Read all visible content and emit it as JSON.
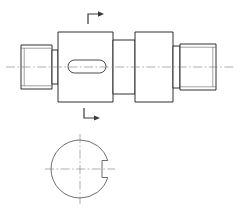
{
  "drawing": {
    "title": "Stepped Shaft with Keyway",
    "sheet_background": "#ffffff",
    "line_color": "#1a1a1a",
    "centerline_color": "#7a7a7a",
    "hatch_color": "#6e6e6e",
    "views": [
      {
        "id": "main-elevation",
        "name": "Main Elevation View",
        "description": "Side view of stepped cylindrical shaft, axis horizontal",
        "axis_y": 67,
        "axis_start_x": 6,
        "axis_end_x": 234,
        "steps": [
          {
            "name": "thread-end-left",
            "x": 21,
            "width": 31,
            "half_height": 22,
            "threaded": true
          },
          {
            "name": "shoulder-left",
            "x": 52,
            "width": 6,
            "half_height": 17,
            "threaded": false
          },
          {
            "name": "keyway-body",
            "x": 58,
            "width": 55,
            "half_height": 35,
            "threaded": false
          },
          {
            "name": "collar-mid",
            "x": 113,
            "width": 22,
            "half_height": 27,
            "threaded": false
          },
          {
            "name": "hub-large",
            "x": 135,
            "width": 38,
            "half_height": 35,
            "threaded": false
          },
          {
            "name": "neck-right",
            "x": 173,
            "width": 7,
            "half_height": 21,
            "threaded": false
          },
          {
            "name": "thread-end-right",
            "x": 180,
            "width": 36,
            "half_height": 23,
            "threaded": true
          }
        ]
      },
      {
        "id": "section-view",
        "name": "Section A-A Cross Section",
        "description": "Hatched circular cross section with keyway notch at right",
        "center_x": 80,
        "center_y": 169,
        "radius": 29,
        "hatch_angle_deg": 45,
        "hatch_spacing": 3.2,
        "keyway_notch": {
          "name": "keyway-notch",
          "depth": 7,
          "width": 17,
          "side": "right"
        }
      }
    ],
    "section_marks": [
      {
        "name": "section-mark-top",
        "label": "",
        "x": 88,
        "y": 14,
        "orientation": "top-left-corner"
      },
      {
        "name": "section-mark-bottom",
        "label": "",
        "x": 84,
        "y": 118,
        "orientation": "bottom-left-corner"
      }
    ],
    "keyway_slot": {
      "name": "keyway-slot",
      "x": 68,
      "y": 60,
      "width": 38,
      "height": 13,
      "radius": 6.5
    }
  }
}
